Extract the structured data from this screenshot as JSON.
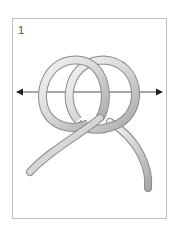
{
  "diagram": {
    "step_number": "1",
    "elements": [
      "rope-loop-left",
      "rope-loop-right",
      "rope-tail-left",
      "rope-tail-right",
      "arrow-left",
      "arrow-right"
    ],
    "colors": {
      "rope": "#d9d9d9",
      "rope_outline": "#8a8a8a",
      "arrow": "#222222",
      "frame": "#bdbdbd"
    }
  }
}
